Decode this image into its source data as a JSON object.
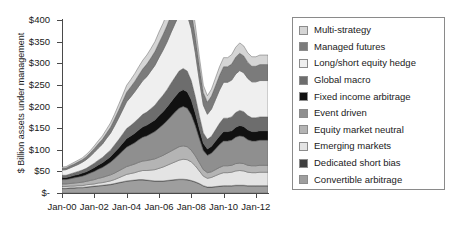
{
  "chart_data": {
    "type": "area",
    "stacked": true,
    "title": "",
    "xlabel": "",
    "ylabel": "$ Billion assets under management",
    "ylim": [
      0,
      400
    ],
    "ytick_labels": [
      "$-",
      "$50",
      "$100",
      "$150",
      "$200",
      "$250",
      "$300",
      "$350",
      "$400"
    ],
    "ytick_values": [
      0,
      50,
      100,
      150,
      200,
      250,
      300,
      350,
      400
    ],
    "xtick_labels": [
      "Jan-00",
      "Jan-02",
      "Jan-04",
      "Jan-06",
      "Jan-08",
      "Jan-10",
      "Jan-12"
    ],
    "xtick_values": [
      2000,
      2002,
      2004,
      2006,
      2008,
      2010,
      2012
    ],
    "xlim": [
      2000,
      2012.75
    ],
    "grid": false,
    "legend_position": "right",
    "x": [
      2000.0,
      2000.25,
      2000.5,
      2000.75,
      2001.0,
      2001.25,
      2001.5,
      2001.75,
      2002.0,
      2002.25,
      2002.5,
      2002.75,
      2003.0,
      2003.25,
      2003.5,
      2003.75,
      2004.0,
      2004.25,
      2004.5,
      2004.75,
      2005.0,
      2005.25,
      2005.5,
      2005.75,
      2006.0,
      2006.25,
      2006.5,
      2006.75,
      2007.0,
      2007.25,
      2007.5,
      2007.75,
      2008.0,
      2008.25,
      2008.5,
      2008.75,
      2009.0,
      2009.25,
      2009.5,
      2009.75,
      2010.0,
      2010.25,
      2010.5,
      2010.75,
      2011.0,
      2011.25,
      2011.5,
      2011.75,
      2012.0,
      2012.25,
      2012.5,
      2012.75
    ],
    "series": [
      {
        "name": "Convertible arbitrage",
        "color": "#9e9e9e",
        "stack_order": 1,
        "values": [
          10,
          10,
          11,
          11,
          12,
          12,
          13,
          14,
          15,
          16,
          17,
          18,
          19,
          21,
          23,
          25,
          27,
          28,
          29,
          30,
          30,
          29,
          28,
          27,
          27,
          27,
          28,
          29,
          30,
          31,
          31,
          30,
          28,
          25,
          21,
          16,
          13,
          13,
          14,
          15,
          16,
          16,
          16,
          17,
          17,
          17,
          16,
          16,
          16,
          16,
          16,
          16
        ]
      },
      {
        "name": "Dedicated short bias",
        "color": "#3f3f3f",
        "stack_order": 2,
        "values": [
          1,
          1,
          1,
          1,
          1,
          1,
          1,
          1,
          1,
          1,
          1,
          1,
          1,
          1,
          1,
          1,
          1,
          1,
          1,
          1,
          1,
          1,
          1,
          1,
          1,
          1,
          1,
          1,
          1,
          1,
          1,
          1,
          1,
          1,
          1,
          1,
          1,
          1,
          1,
          1,
          1,
          1,
          1,
          1,
          1,
          1,
          1,
          1,
          1,
          1,
          1,
          1
        ]
      },
      {
        "name": "Emerging markets",
        "color": "#e4e4e4",
        "stack_order": 3,
        "values": [
          4,
          4,
          4,
          4,
          4,
          4,
          5,
          5,
          5,
          6,
          6,
          7,
          8,
          9,
          11,
          13,
          15,
          16,
          17,
          19,
          21,
          22,
          24,
          26,
          29,
          32,
          35,
          38,
          41,
          44,
          46,
          46,
          43,
          37,
          29,
          22,
          20,
          22,
          25,
          28,
          30,
          30,
          31,
          33,
          34,
          33,
          31,
          30,
          30,
          31,
          31,
          31
        ]
      },
      {
        "name": "Equity market neutral",
        "color": "#b4b4b4",
        "stack_order": 4,
        "values": [
          6,
          6,
          6,
          7,
          7,
          8,
          8,
          9,
          10,
          11,
          12,
          13,
          14,
          15,
          16,
          17,
          18,
          19,
          20,
          21,
          22,
          23,
          24,
          25,
          26,
          27,
          28,
          29,
          30,
          31,
          31,
          30,
          27,
          23,
          19,
          15,
          13,
          13,
          14,
          15,
          16,
          16,
          16,
          17,
          17,
          17,
          16,
          16,
          16,
          16,
          16,
          16
        ]
      },
      {
        "name": "Event driven",
        "color": "#8f8f8f",
        "stack_order": 5,
        "values": [
          10,
          10,
          11,
          12,
          13,
          14,
          15,
          17,
          19,
          21,
          23,
          26,
          29,
          33,
          37,
          41,
          45,
          47,
          49,
          52,
          55,
          57,
          60,
          63,
          67,
          71,
          75,
          80,
          85,
          89,
          91,
          89,
          82,
          70,
          56,
          44,
          40,
          43,
          48,
          53,
          57,
          57,
          58,
          61,
          63,
          62,
          59,
          57,
          57,
          58,
          58,
          58
        ]
      },
      {
        "name": "Fixed income arbitrage",
        "color": "#111111",
        "stack_order": 6,
        "values": [
          5,
          5,
          5,
          6,
          6,
          7,
          7,
          8,
          9,
          10,
          11,
          12,
          13,
          15,
          16,
          18,
          20,
          21,
          22,
          23,
          24,
          25,
          26,
          27,
          29,
          30,
          32,
          34,
          36,
          38,
          39,
          38,
          35,
          29,
          23,
          17,
          15,
          16,
          18,
          20,
          22,
          22,
          22,
          23,
          24,
          24,
          23,
          22,
          22,
          22,
          22,
          22
        ]
      },
      {
        "name": "Global macro",
        "color": "#6d6d6d",
        "stack_order": 7,
        "values": [
          5,
          5,
          6,
          6,
          7,
          7,
          8,
          9,
          10,
          11,
          12,
          14,
          15,
          17,
          19,
          21,
          23,
          24,
          26,
          27,
          29,
          30,
          32,
          34,
          36,
          38,
          40,
          43,
          45,
          48,
          49,
          48,
          44,
          38,
          30,
          24,
          22,
          23,
          26,
          29,
          31,
          31,
          32,
          34,
          35,
          34,
          33,
          32,
          32,
          32,
          32,
          32
        ]
      },
      {
        "name": "Long/short equity hedge",
        "color": "#efefef",
        "stack_order": 8,
        "values": [
          12,
          13,
          14,
          15,
          16,
          18,
          20,
          22,
          25,
          28,
          31,
          35,
          39,
          44,
          50,
          56,
          62,
          66,
          70,
          74,
          78,
          82,
          87,
          92,
          98,
          104,
          110,
          117,
          124,
          130,
          133,
          130,
          120,
          102,
          82,
          64,
          58,
          63,
          70,
          77,
          83,
          83,
          85,
          89,
          92,
          90,
          86,
          83,
          83,
          84,
          84,
          84
        ]
      },
      {
        "name": "Managed futures",
        "color": "#7b7b7b",
        "stack_order": 9,
        "values": [
          4,
          4,
          5,
          5,
          6,
          6,
          7,
          8,
          9,
          10,
          11,
          12,
          14,
          16,
          18,
          20,
          22,
          23,
          24,
          26,
          27,
          29,
          30,
          32,
          34,
          36,
          38,
          41,
          43,
          45,
          46,
          45,
          42,
          38,
          33,
          29,
          28,
          30,
          32,
          34,
          36,
          36,
          37,
          39,
          40,
          39,
          37,
          36,
          36,
          37,
          37,
          37
        ]
      },
      {
        "name": "Multi-strategy",
        "color": "#d5d5d5",
        "stack_order": 10,
        "values": [
          3,
          3,
          3,
          4,
          4,
          4,
          5,
          5,
          6,
          7,
          8,
          9,
          10,
          11,
          13,
          14,
          16,
          17,
          18,
          19,
          20,
          21,
          22,
          23,
          25,
          26,
          28,
          30,
          31,
          33,
          34,
          33,
          31,
          26,
          21,
          17,
          15,
          16,
          18,
          20,
          21,
          21,
          22,
          23,
          24,
          23,
          22,
          22,
          22,
          22,
          22,
          22
        ]
      }
    ]
  },
  "legend": {
    "items": [
      {
        "label": "Multi-strategy",
        "color": "#d5d5d5"
      },
      {
        "label": "Managed futures",
        "color": "#7b7b7b"
      },
      {
        "label": "Long/short equity hedge",
        "color": "#efefef"
      },
      {
        "label": "Global macro",
        "color": "#6d6d6d"
      },
      {
        "label": "Fixed income arbitrage",
        "color": "#111111"
      },
      {
        "label": "Event driven",
        "color": "#8f8f8f"
      },
      {
        "label": "Equity market neutral",
        "color": "#b4b4b4"
      },
      {
        "label": "Emerging markets",
        "color": "#e4e4e4"
      },
      {
        "label": "Dedicated short bias",
        "color": "#3f3f3f"
      },
      {
        "label": "Convertible arbitrage",
        "color": "#9e9e9e"
      }
    ]
  }
}
